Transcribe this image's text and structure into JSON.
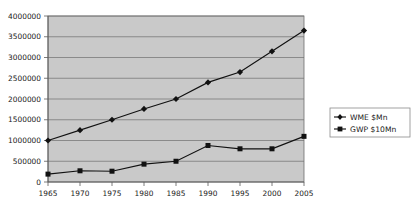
{
  "chart_data": {
    "type": "line",
    "title": "",
    "xlabel": "",
    "ylabel": "",
    "categories": [
      1965,
      1970,
      1975,
      1980,
      1985,
      1990,
      1995,
      2000,
      2005
    ],
    "x_tick_labels": [
      "1965",
      "1970",
      "1975",
      "1980",
      "1985",
      "1990",
      "1995",
      "2000",
      "2005"
    ],
    "y_tick_labels": [
      "0",
      "500000",
      "1000000",
      "1500000",
      "2000000",
      "2500000",
      "3000000",
      "3500000",
      "4000000"
    ],
    "y_tick_values": [
      0,
      500000,
      1000000,
      1500000,
      2000000,
      2500000,
      3000000,
      3500000,
      4000000
    ],
    "ylim": [
      0,
      4000000
    ],
    "grid": true,
    "grid_axis": "y",
    "legend_position": "right",
    "plot_background": "#c9c9c9",
    "series": [
      {
        "name": "WME $Mn",
        "marker": "diamond",
        "color": "#111111",
        "values": [
          1000000,
          1250000,
          1500000,
          1760000,
          2000000,
          2400000,
          2650000,
          3150000,
          3650000
        ]
      },
      {
        "name": "GWP $10Mn",
        "marker": "square",
        "color": "#111111",
        "values": [
          190000,
          270000,
          260000,
          430000,
          500000,
          880000,
          800000,
          800000,
          1100000
        ]
      }
    ],
    "legend_entries": [
      "WME $Mn",
      "GWP $10Mn"
    ]
  }
}
